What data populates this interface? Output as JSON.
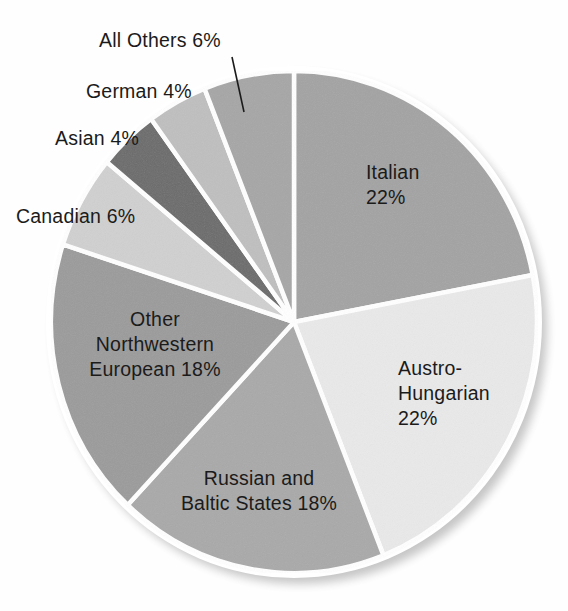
{
  "chart_data": {
    "type": "pie",
    "title": "",
    "subtitle": "",
    "xlabel": "",
    "ylabel": "",
    "legend_position": "none",
    "grid": false,
    "units": "percent",
    "start_angle_deg": 0,
    "direction": "clockwise",
    "total": 100,
    "slices": [
      {
        "label": "Italian",
        "value": 22,
        "value_text": "22%",
        "color": "#a3a3a3",
        "label_lines": [
          "Italian",
          "22%"
        ]
      },
      {
        "label": "Austro-Hungarian",
        "value": 22,
        "value_text": "22%",
        "color": "#e9e9e9",
        "label_lines": [
          "Austro-",
          "Hungarian",
          "22%"
        ]
      },
      {
        "label": "Russian and Baltic States",
        "value": 18,
        "value_text": "18%",
        "color": "#a9a9a9",
        "label_lines": [
          "Russian and",
          "Baltic States 18%"
        ]
      },
      {
        "label": "Other Northwestern European",
        "value": 18,
        "value_text": "18%",
        "color": "#9b9b9b",
        "label_lines": [
          "Other",
          "Northwestern",
          "European 18%"
        ]
      },
      {
        "label": "Canadian",
        "value": 6,
        "value_text": "6%",
        "color": "#d0d0d0",
        "label_lines": [
          "Canadian 6%"
        ]
      },
      {
        "label": "Asian",
        "value": 4,
        "value_text": "4%",
        "color": "#6b6b6b",
        "label_lines": [
          "Asian 4%"
        ]
      },
      {
        "label": "German",
        "value": 4,
        "value_text": "4%",
        "color": "#bfbfbf",
        "label_lines": [
          "German 4%"
        ]
      },
      {
        "label": "All Others",
        "value": 6,
        "value_text": "6%",
        "color": "#a6a6a6",
        "label_lines": [
          "All Others 6%"
        ]
      }
    ],
    "categories": [
      "Italian",
      "Austro-Hungarian",
      "Russian and Baltic States",
      "Other Northwestern European",
      "Canadian",
      "Asian",
      "German",
      "All Others"
    ],
    "values": [
      22,
      22,
      18,
      18,
      6,
      4,
      4,
      6
    ]
  },
  "labels": {
    "all_others": "All Others 6%",
    "german": "German 4%",
    "asian": "Asian 4%",
    "canadian": "Canadian 6%",
    "italian_line1": "Italian",
    "italian_line2": "22%",
    "austro_line1": "Austro-",
    "austro_line2": "Hungarian",
    "austro_line3": "22%",
    "other_nw_line1": "Other",
    "other_nw_line2": "Northwestern",
    "other_nw_line3": "European 18%",
    "russian_line1": "Russian and",
    "russian_line2": "Baltic States 18%"
  },
  "style": {
    "separator_color": "#ffffff",
    "rim_color": "#ffffff",
    "text_color": "#1b1b1b",
    "background": "#fefefe"
  }
}
